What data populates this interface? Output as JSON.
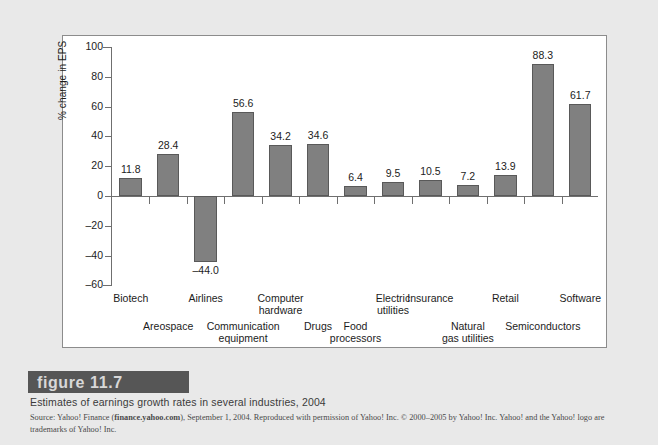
{
  "figure": {
    "band_label": "figure  11.7",
    "caption": "Estimates of earnings growth rates in several industries, 2004",
    "source_prefix": "Source: Yahoo! Finance (",
    "source_link": "finance.yahoo.com",
    "source_suffix": "), September 1, 2004. Reproduced with permission of Yahoo! Inc. © 2000–2005 by Yahoo! Inc. Yahoo! and the Yahoo! logo are trademarks of Yahoo! Inc."
  },
  "colors": {
    "page_background": "#e9e9e9",
    "plot_background": "#ffffff",
    "bar_fill": "#808080",
    "bar_edge": "#595959",
    "axis": "#6f6f6f",
    "band": "#565656",
    "text": "#1c1c1c"
  },
  "chart_data": {
    "type": "bar",
    "title": "Estimates of earnings growth rates in several industries, 2004",
    "xlabel": "",
    "ylabel": "% change in EPS",
    "ylim": [
      -60,
      100
    ],
    "yticks": [
      100,
      80,
      60,
      40,
      20,
      0,
      -20,
      -40,
      -60
    ],
    "ytick_labels": [
      "100",
      "80",
      "60",
      "40",
      "20",
      "0",
      "-20",
      "-40",
      "-60"
    ],
    "yminor_step": 10,
    "grid": false,
    "legend": null,
    "categories": [
      "Biotech",
      "Areospace",
      "Airlines",
      "Communication\nequipment",
      "Computer\nhardware",
      "Drugs",
      "Food\nprocessors",
      "Electric\nutilities",
      "Insurance",
      "Natural\ngas utilities",
      "Retail",
      "Semiconductors",
      "Software"
    ],
    "values": [
      11.8,
      28.4,
      -44.0,
      56.6,
      34.2,
      34.6,
      6.4,
      9.5,
      10.5,
      7.2,
      13.9,
      88.3,
      61.7
    ],
    "data_labels": [
      "11.8",
      "28.4",
      "-44.0",
      "56.6",
      "34.2",
      "34.6",
      "6.4",
      "9.5",
      "10.5",
      "7.2",
      "13.9",
      "88.3",
      "61.7"
    ],
    "label_rows": [
      0,
      1,
      0,
      1,
      0,
      1,
      1,
      0,
      0,
      1,
      0,
      1,
      0
    ]
  }
}
